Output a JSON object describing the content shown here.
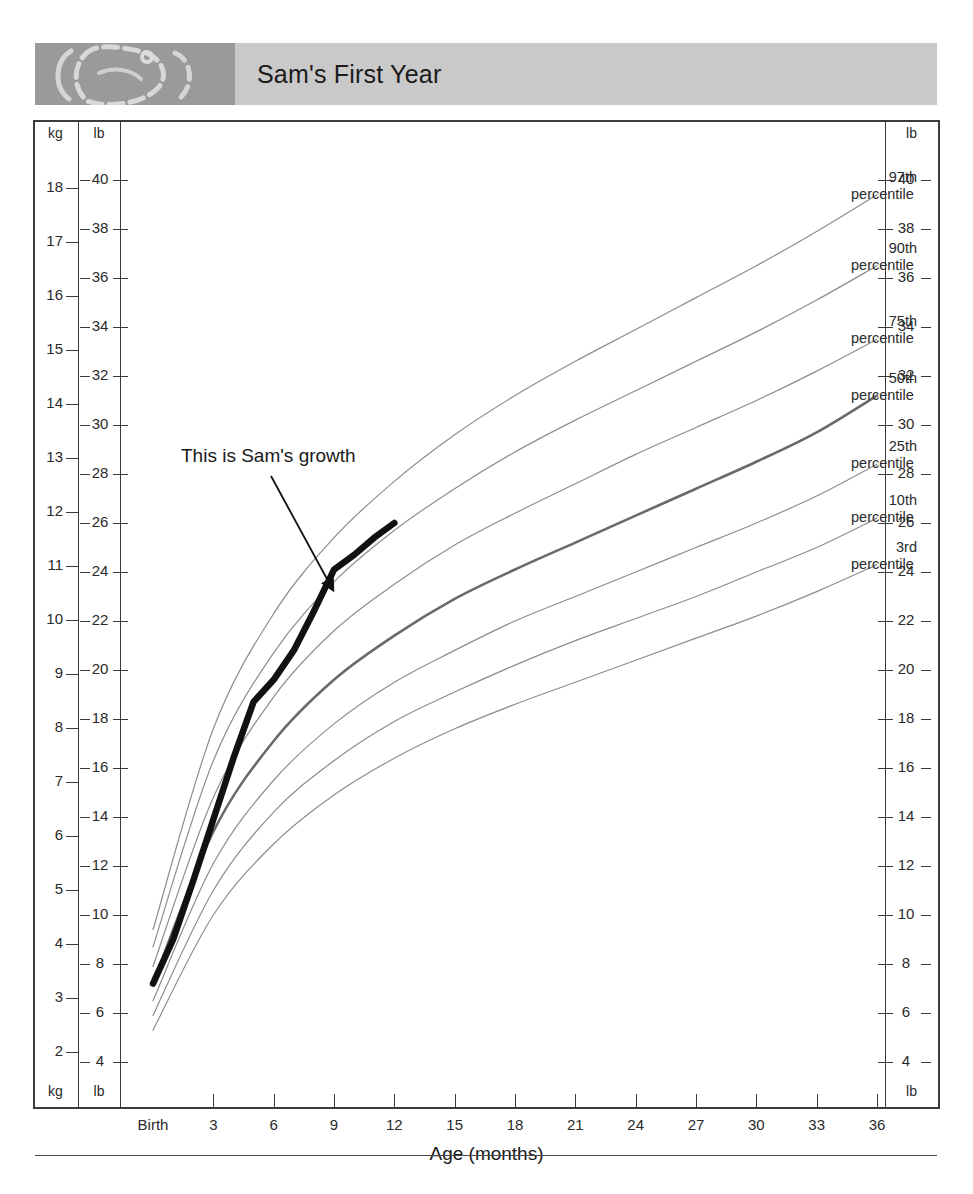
{
  "header": {
    "title": "Sam's First Year",
    "image_alt": "decorative-footprint-graphic"
  },
  "axes": {
    "left_kg_header": "kg",
    "left_lb_header": "lb",
    "left_kg_footer": "kg",
    "left_lb_footer": "lb",
    "right_lb_header": "lb",
    "right_lb_footer": "lb",
    "x_title": "Age (months)",
    "kg_ticks": [
      18,
      17,
      16,
      15,
      14,
      13,
      12,
      11,
      10,
      9,
      8,
      7,
      6,
      5,
      4,
      3,
      2
    ],
    "lb_ticks": [
      40,
      38,
      36,
      34,
      32,
      30,
      28,
      26,
      24,
      22,
      20,
      18,
      16,
      14,
      12,
      10,
      8,
      6,
      4
    ],
    "x_ticks": [
      "Birth",
      "3",
      "6",
      "9",
      "12",
      "15",
      "18",
      "21",
      "24",
      "27",
      "30",
      "33",
      "36"
    ]
  },
  "annotation": {
    "text": "This is Sam's growth"
  },
  "percentile_labels": [
    {
      "rank": "97th",
      "word": "percentile"
    },
    {
      "rank": "90th",
      "word": "percentile"
    },
    {
      "rank": "75th",
      "word": "percentile"
    },
    {
      "rank": "50th",
      "word": "percentile"
    },
    {
      "rank": "25th",
      "word": "percentile"
    },
    {
      "rank": "10th",
      "word": "percentile"
    },
    {
      "rank": "3rd",
      "word": "percentile"
    }
  ],
  "colors": {
    "banner_image": "#9a9a9a",
    "banner_band": "#c9c9c9",
    "frame": "#3b3b3b",
    "percentile_line": "#8d8d8d",
    "percentile_50_line": "#6a6a6a",
    "subject_line": "#111111"
  },
  "chart_data": {
    "type": "line",
    "title": "Sam's First Year",
    "xlabel": "Age (months)",
    "ylabel": "lb",
    "y2label": "kg",
    "xlim": [
      0,
      36
    ],
    "ylim_lb": [
      4,
      40
    ],
    "ylim_kg": [
      2,
      18
    ],
    "grid": false,
    "legend": "inline-right-labels",
    "x": [
      0,
      3,
      6,
      9,
      12,
      15,
      18,
      21,
      24,
      27,
      30,
      33,
      36
    ],
    "series": [
      {
        "name": "97th percentile",
        "units": "lb",
        "values": [
          9.4,
          17.6,
          22.3,
          25.4,
          27.7,
          29.6,
          31.2,
          32.6,
          33.9,
          35.2,
          36.5,
          37.9,
          39.4
        ]
      },
      {
        "name": "90th percentile",
        "units": "lb",
        "values": [
          8.7,
          16.3,
          20.7,
          23.6,
          25.7,
          27.4,
          28.9,
          30.2,
          31.4,
          32.6,
          33.8,
          35.1,
          36.5
        ]
      },
      {
        "name": "75th percentile",
        "units": "lb",
        "values": [
          7.9,
          14.8,
          18.9,
          21.6,
          23.5,
          25.1,
          26.4,
          27.6,
          28.8,
          29.9,
          31.0,
          32.2,
          33.5
        ]
      },
      {
        "name": "50th percentile",
        "units": "lb",
        "values": [
          7.2,
          13.4,
          17.1,
          19.6,
          21.4,
          22.9,
          24.1,
          25.2,
          26.3,
          27.4,
          28.5,
          29.7,
          31.2
        ]
      },
      {
        "name": "25th percentile",
        "units": "lb",
        "values": [
          6.5,
          12.1,
          15.5,
          17.8,
          19.5,
          20.8,
          22.0,
          23.0,
          24.0,
          25.0,
          26.0,
          27.1,
          28.4
        ]
      },
      {
        "name": "10th percentile",
        "units": "lb",
        "values": [
          5.9,
          11.0,
          14.2,
          16.3,
          17.9,
          19.1,
          20.2,
          21.2,
          22.1,
          23.0,
          24.0,
          25.0,
          26.2
        ]
      },
      {
        "name": "3rd percentile",
        "units": "lb",
        "values": [
          5.3,
          10.0,
          12.9,
          14.9,
          16.4,
          17.6,
          18.6,
          19.5,
          20.4,
          21.3,
          22.2,
          23.2,
          24.3
        ]
      },
      {
        "name": "Sam's growth",
        "units": "lb",
        "highlight": true,
        "x": [
          0,
          1,
          2,
          3,
          4,
          5,
          6,
          7,
          8,
          9,
          10,
          11,
          12
        ],
        "values": [
          7.2,
          9.0,
          11.4,
          13.9,
          16.4,
          18.7,
          19.6,
          20.8,
          22.4,
          24.1,
          24.7,
          25.4,
          26.0
        ]
      }
    ]
  }
}
